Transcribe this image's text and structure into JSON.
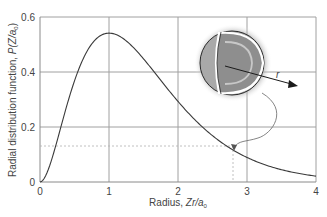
{
  "chart_data": {
    "type": "line",
    "title": "",
    "xlabel": "Radius, Zr/a0",
    "ylabel": "Radial distribution function, P(Z/a0)",
    "xlim": [
      0,
      4
    ],
    "ylim": [
      0,
      0.6
    ],
    "x_ticks": [
      "0",
      "1",
      "2",
      "3",
      "4"
    ],
    "y_ticks": [
      "0",
      "0.2",
      "0.4",
      "0.6"
    ],
    "grid": true,
    "legend": null,
    "series": [
      {
        "name": "P(r) = 4 (Z/a0)^3 r^2 e^(-2Zr/a0)",
        "x": [
          0,
          0.25,
          0.5,
          0.75,
          1.0,
          1.25,
          1.5,
          1.75,
          2.0,
          2.25,
          2.5,
          2.75,
          3.0,
          3.25,
          3.5,
          3.75,
          4.0
        ],
        "y": [
          0,
          0.152,
          0.368,
          0.502,
          0.541,
          0.513,
          0.448,
          0.37,
          0.293,
          0.225,
          0.168,
          0.124,
          0.089,
          0.064,
          0.045,
          0.031,
          0.021
        ]
      }
    ],
    "annotations": [
      {
        "type": "dashed-guide",
        "x": 2.8,
        "y": 0.13
      },
      {
        "type": "inset",
        "description": "cut-away hydrogenic atom sphere with radius arrow labelled r, curved arrow pointing to the curve at Zr/a0 ≈ 2.8"
      },
      {
        "type": "text",
        "label": "r"
      }
    ]
  },
  "labels": {
    "y_axis_main": "Radial distribution function, ",
    "y_axis_italic": "P",
    "y_axis_paren": "(Z/a",
    "y_axis_sub": "0",
    "y_axis_close": ")",
    "x_axis_main": "Radius, ",
    "x_axis_italic": "Zr/a",
    "x_axis_sub": "0",
    "radius_label": "r"
  },
  "colors": {
    "curve": "#3a3a3a",
    "grid": "#9a9a9a",
    "sphere_outer": "#a8a8a8",
    "sphere_inner": "#8c8c8c",
    "halo": "#6e6e6e"
  }
}
